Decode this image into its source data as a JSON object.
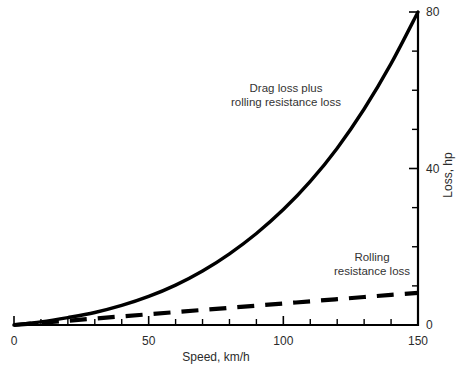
{
  "chart_data": {
    "type": "line",
    "title": "",
    "xlabel": "Speed, km/h",
    "ylabel": "Loss, hp",
    "xlim": [
      0,
      150
    ],
    "ylim": [
      0,
      80
    ],
    "grid": false,
    "legend_position": "inline-annotations",
    "x_ticks_major": [
      0,
      50,
      100,
      150
    ],
    "x_ticks_major_labels": [
      "0",
      "50",
      "100",
      "150"
    ],
    "x_ticks_minor_step": 10,
    "y_ticks_major": [
      0,
      40,
      80
    ],
    "y_ticks_major_labels": [
      "0",
      "40",
      "80"
    ],
    "y_ticks_minor_step": 10,
    "y_axis_side": "right",
    "x": [
      0,
      10,
      20,
      30,
      40,
      50,
      60,
      70,
      80,
      90,
      100,
      110,
      120,
      130,
      140,
      150
    ],
    "series": [
      {
        "name": "Drag loss plus rolling resistance loss",
        "style": "solid",
        "values": [
          0.0,
          0.8,
          1.9,
          3.2,
          5.0,
          7.3,
          10.2,
          13.8,
          18.2,
          23.4,
          29.5,
          36.7,
          45.2,
          55.2,
          66.8,
          80.0
        ]
      },
      {
        "name": "Rolling resistance loss",
        "style": "dashed",
        "values": [
          0.0,
          0.55,
          1.1,
          1.65,
          2.2,
          2.75,
          3.3,
          3.85,
          4.4,
          4.95,
          5.5,
          6.05,
          6.6,
          7.15,
          7.7,
          8.2
        ]
      }
    ],
    "annotations": [
      {
        "id": "drag-plus-rolling",
        "lines": [
          "Drag loss plus",
          "rolling resistance loss"
        ],
        "x_px": 286,
        "y_px": 92
      },
      {
        "id": "rolling-only",
        "lines": [
          "Rolling",
          "resistance loss"
        ],
        "x_px": 372,
        "y_px": 261
      }
    ],
    "colors": {
      "axis": "#000000",
      "series_solid": "#000000",
      "series_dashed": "#000000",
      "text": "#2b2b2b",
      "background": "#ffffff"
    }
  }
}
